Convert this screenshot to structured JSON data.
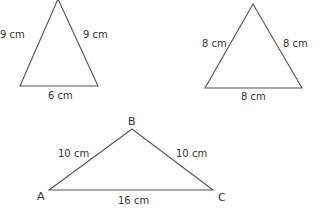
{
  "triangles": [
    {
      "id": "isosceles-9-9-6",
      "sides": {
        "left": "9 cm",
        "right": "9 cm",
        "base": "6 cm"
      }
    },
    {
      "id": "equilateral-8",
      "sides": {
        "left": "8 cm",
        "right": "8 cm",
        "base": "8 cm"
      }
    },
    {
      "id": "isosceles-ABC",
      "vertices": {
        "top": "B",
        "left": "A",
        "right": "C"
      },
      "sides": {
        "left": "10 cm",
        "right": "10 cm",
        "base": "16 cm"
      }
    }
  ],
  "colors": {
    "stroke": "#555555",
    "text": "#333333",
    "background": "#ffffff"
  }
}
